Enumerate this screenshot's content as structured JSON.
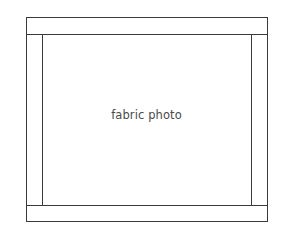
{
  "diagram": {
    "label": "fabric photo",
    "outer_frame": {
      "left": 26,
      "top": 17,
      "right": 267,
      "bottom": 221
    },
    "top_strip_bottom": 34,
    "bottom_strip_top": 205,
    "left_strip_right": 42,
    "right_strip_left": 251,
    "line_color": "#3a3a3a",
    "text_color": "#4a4a4a"
  }
}
